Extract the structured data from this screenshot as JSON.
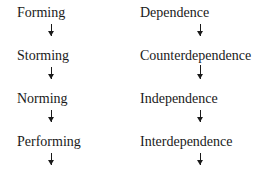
{
  "diagram": {
    "left_column": {
      "name": "Tuckman group stages",
      "stages": [
        "Forming",
        "Storming",
        "Norming",
        "Performing"
      ]
    },
    "right_column": {
      "name": "Dependency stages",
      "stages": [
        "Dependence",
        "Counterdependence",
        "Independence",
        "Interdependence"
      ]
    },
    "connector": "down-arrow"
  }
}
